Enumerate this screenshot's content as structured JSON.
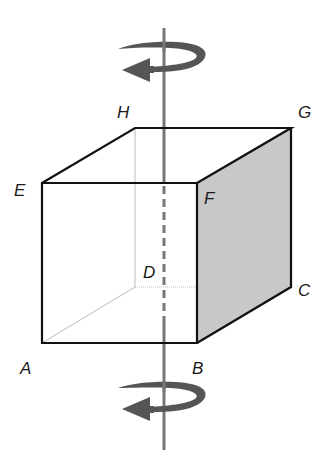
{
  "diagram": {
    "colors": {
      "edge": "#111111",
      "hidden_edge": "#bbbbbb",
      "shaded_face": "#c8c8c8",
      "axis": "#777777",
      "arrow": "#555555"
    },
    "vertices": {
      "A": {
        "label": "A",
        "x": 42,
        "y": 343
      },
      "B": {
        "label": "B",
        "x": 197,
        "y": 343
      },
      "C": {
        "label": "C",
        "x": 291,
        "y": 287
      },
      "D": {
        "label": "D",
        "x": 135,
        "y": 287
      },
      "E": {
        "label": "E",
        "x": 42,
        "y": 183
      },
      "F": {
        "label": "F",
        "x": 197,
        "y": 183
      },
      "G": {
        "label": "G",
        "x": 291,
        "y": 128
      },
      "H": {
        "label": "H",
        "x": 135,
        "y": 128
      }
    },
    "labels": [
      {
        "name": "A",
        "text": "A",
        "x": 20,
        "y": 374
      },
      {
        "name": "B",
        "text": "B",
        "x": 192,
        "y": 374
      },
      {
        "name": "C",
        "text": "C",
        "x": 298,
        "y": 296
      },
      {
        "name": "D",
        "text": "D",
        "x": 143,
        "y": 278
      },
      {
        "name": "E",
        "text": "E",
        "x": 14,
        "y": 196
      },
      {
        "name": "F",
        "text": "F",
        "x": 204,
        "y": 204
      },
      {
        "name": "G",
        "text": "G",
        "x": 298,
        "y": 118
      },
      {
        "name": "H",
        "text": "H",
        "x": 117,
        "y": 118
      }
    ],
    "axis": {
      "x": 164,
      "top": 28,
      "bottom": 450,
      "dashed_from": 183,
      "dashed_to": 322
    },
    "rotation_arrows": [
      {
        "name": "top-rotation-arrow",
        "cy": 56
      },
      {
        "name": "bottom-rotation-arrow",
        "cy": 400
      }
    ]
  }
}
